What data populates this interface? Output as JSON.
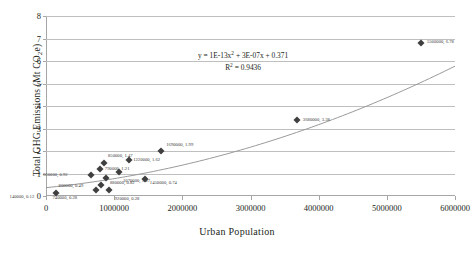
{
  "chart_data": {
    "type": "scatter",
    "title": "",
    "xlabel": "Urban Population",
    "ylabel": "Total GHG Emissions (Mt CO2e)",
    "ylabel_prefix": "Total GHG Emissions (Mt CO",
    "ylabel_sub": "2",
    "ylabel_suffix": "e)",
    "xlim": [
      0,
      6000000
    ],
    "ylim": [
      0,
      8
    ],
    "grid": true,
    "legend": "none",
    "marker_color": "#3f3f3f",
    "trendline_color": "#9a9a9a",
    "gridline_color": "#bfbfbf",
    "axis_color": "#a6a6a6",
    "xticks": [
      "0",
      "1000000",
      "2000000",
      "3000000",
      "4000000",
      "5000000",
      "6000000"
    ],
    "xtick_values": [
      0,
      1000000,
      2000000,
      3000000,
      4000000,
      5000000,
      6000000
    ],
    "yticks": [
      "0",
      "1",
      "2",
      "3",
      "4",
      "5",
      "6",
      "7",
      "8"
    ],
    "ytick_values": [
      0,
      1,
      2,
      3,
      4,
      5,
      6,
      7,
      8
    ],
    "points": [
      {
        "x": 140000,
        "y": 0.12,
        "label": "140000, 0.12",
        "lx": -46,
        "ly": 3
      },
      {
        "x": 740000,
        "y": 0.28,
        "label": "740000, 0.28",
        "lx": -44,
        "ly": 7
      },
      {
        "x": 800000,
        "y": 0.49,
        "label": "800000, 0.49",
        "lx": -42,
        "ly": 0
      },
      {
        "x": 920000,
        "y": 0.28,
        "label": "920000, 0.28",
        "lx": 6,
        "ly": 8
      },
      {
        "x": 660000,
        "y": 0.92,
        "label": "660000, 0.92",
        "lx": -48,
        "ly": -1
      },
      {
        "x": 790000,
        "y": 1.21,
        "label": "790000, 1.21",
        "lx": 5,
        "ly": -1
      },
      {
        "x": 850000,
        "y": 1.47,
        "label": "850000, 1.47",
        "lx": 4,
        "ly": -8
      },
      {
        "x": 880000,
        "y": 0.82,
        "label": "880000, 0.82",
        "lx": 4,
        "ly": 4
      },
      {
        "x": 1070000,
        "y": 1.07,
        "label": "1070000, 1.07",
        "lx": 4,
        "ly": 8
      },
      {
        "x": 1220000,
        "y": 1.62,
        "label": "1220000, 1.62",
        "lx": 4,
        "ly": -1
      },
      {
        "x": 1450000,
        "y": 0.74,
        "label": "1450000, 0.74",
        "lx": 5,
        "ly": 3
      },
      {
        "x": 1690000,
        "y": 1.99,
        "label": "1690000, 1.99",
        "lx": 5,
        "ly": -7
      },
      {
        "x": 3680000,
        "y": 3.38,
        "label": "3680000, 3.38",
        "lx": 6,
        "ly": -1
      },
      {
        "x": 5500000,
        "y": 6.78,
        "label": "5500000, 6.78",
        "lx": 6,
        "ly": -2
      }
    ],
    "trendline": {
      "type": "polynomial",
      "order": 2,
      "a": 1e-13,
      "b": 3e-07,
      "c": 0.371,
      "equation_text": "y = 1E-13x2 + 3E-07x + 0.371",
      "equation_prefix": "y = 1E-13x",
      "equation_sup": "2",
      "equation_suffix": " + 3E-07x + 0.371",
      "r2_prefix": "R",
      "r2_sup": "2",
      "r2_suffix": " = 0.9436",
      "r2_text": "R2 = 0.9436",
      "r2_value": 0.9436
    }
  }
}
